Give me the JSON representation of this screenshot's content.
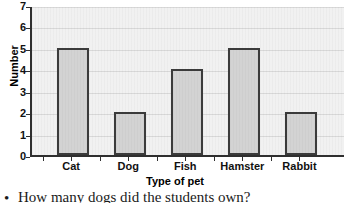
{
  "chart_data": {
    "type": "bar",
    "title": "",
    "subtitle": "",
    "categories": [
      "Cat",
      "Dog",
      "Fish",
      "Hamster",
      "Rabbit"
    ],
    "values": [
      5,
      2,
      4,
      5,
      2
    ],
    "xlabel": "Type of pet",
    "ylabel": "Number",
    "ylim": [
      0,
      7
    ],
    "ytick_step": 1,
    "yticks": [
      "0",
      "1",
      "2",
      "3",
      "4",
      "5",
      "6",
      "7"
    ],
    "grid": true,
    "grid_axis": "y",
    "legend": null,
    "legend_position": "none",
    "bar_fill_color": "#d3d3d3",
    "bar_border_color": "#3b3b3b",
    "plot_background_color": "#f1f1f1",
    "axis_color": "#2f2f2f",
    "gridline_color": "#d8d8d8"
  },
  "caption": {
    "bullet": "•",
    "text": "How many dogs did the students own?"
  }
}
